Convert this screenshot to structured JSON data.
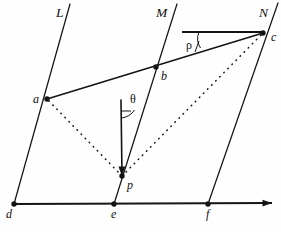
{
  "figure": {
    "background_color": "#fefefe",
    "ink_color": "#141414",
    "width": 281,
    "height": 232
  },
  "lines": [
    {
      "name": "L",
      "label": "L",
      "label_x": 56,
      "label_y": 17,
      "x1": 70,
      "y1": 4,
      "x2": 14,
      "y2": 204
    },
    {
      "name": "M",
      "label": "M",
      "label_x": 156,
      "label_y": 17,
      "x1": 177,
      "y1": 4,
      "x2": 114,
      "y2": 204
    },
    {
      "name": "N",
      "label": "N",
      "label_x": 259,
      "label_y": 17,
      "x1": 278,
      "y1": 3,
      "x2": 208,
      "y2": 204
    }
  ],
  "points": [
    {
      "name": "a",
      "label": "a",
      "x": 47,
      "y": 99,
      "label_x": 33,
      "label_y": 103
    },
    {
      "name": "b",
      "label": "b",
      "x": 156,
      "y": 67,
      "label_x": 161,
      "label_y": 80
    },
    {
      "name": "c",
      "label": "c",
      "x": 263,
      "y": 33,
      "label_x": 271,
      "label_y": 41
    },
    {
      "name": "d",
      "label": "d",
      "x": 14,
      "y": 204,
      "label_x": 6,
      "label_y": 218
    },
    {
      "name": "e",
      "label": "e",
      "x": 114,
      "y": 204,
      "label_x": 111,
      "label_y": 218
    },
    {
      "name": "f",
      "label": "f",
      "x": 208,
      "y": 204,
      "label_x": 206,
      "label_y": 218
    },
    {
      "name": "p",
      "label": "p",
      "x": 122,
      "y": 176,
      "label_x": 127,
      "label_y": 189
    }
  ],
  "segments": [
    {
      "name": "segment-a-c",
      "from": "a",
      "to": "c",
      "style": "solid"
    }
  ],
  "dotted_segments": [
    {
      "name": "dotted-p-a",
      "from": "p",
      "to": "a"
    },
    {
      "name": "dotted-p-c",
      "from": "p",
      "to": "c"
    }
  ],
  "base_axis": {
    "name": "base-axis-def",
    "x1": 14,
    "y1": 204,
    "x2": 272,
    "y2": 203,
    "arrow": true
  },
  "vertical_ray": {
    "name": "vertical-ray-to-p",
    "x1": 121,
    "y1": 100,
    "x2": 122,
    "y2": 176,
    "arrow": true
  },
  "horizontal_ray": {
    "name": "horizontal-ray-at-c",
    "x1": 182,
    "y1": 32,
    "x2": 263,
    "y2": 32
  },
  "angles": [
    {
      "name": "angle-theta",
      "symbol": "θ",
      "label_x": 130,
      "label_y": 103,
      "vertex_x": 121,
      "vertex_y": 100,
      "tick_x1": 121,
      "tick_y1": 111,
      "tick_x2": 130,
      "tick_y2": 111,
      "arc_path": "M 121.5 118 A 18 18 0 0 0 134.5 110"
    },
    {
      "name": "angle-rho",
      "symbol": "ρ",
      "label_x": 186,
      "label_y": 49,
      "vertex_x": 263,
      "vertex_y": 33,
      "tick_x1": 182,
      "tick_y1": 32,
      "tick_x2": 182,
      "tick_y2": 42,
      "arc_path": "M 199 32 A 17 17 0 0 0 200.5 48"
    }
  ],
  "angle_legs": [
    {
      "name": "theta-leg-tick",
      "x1": 121,
      "y1": 111,
      "x2": 131,
      "y2": 111
    },
    {
      "name": "rho-leg-tick",
      "x1": 195,
      "y1": 52,
      "x2": 199,
      "y2": 41
    }
  ]
}
